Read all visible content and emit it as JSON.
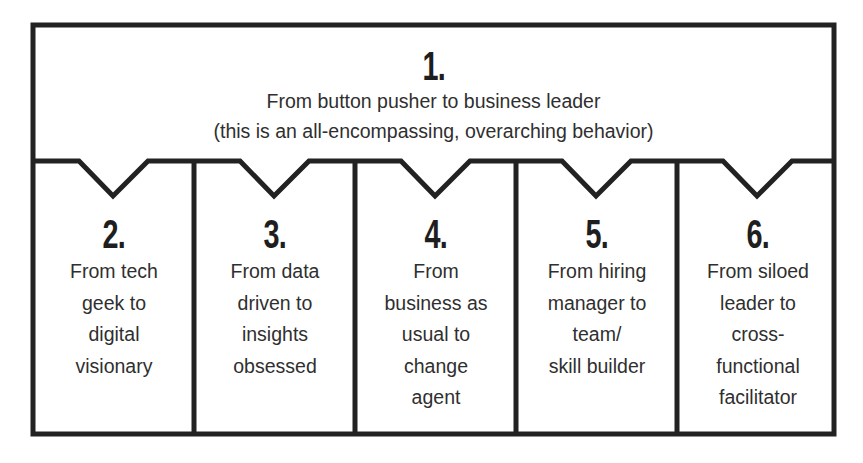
{
  "diagram": {
    "top": {
      "number": "1.",
      "title": "From button pusher to business leader",
      "subtitle": "(this is an all-encompassing, overarching behavior)"
    },
    "columns": [
      {
        "number": "2.",
        "lines": [
          "From tech",
          "geek to",
          "digital",
          "visionary"
        ]
      },
      {
        "number": "3.",
        "lines": [
          "From data",
          "driven to",
          "insights",
          "obsessed"
        ]
      },
      {
        "number": "4.",
        "lines": [
          "From",
          "business as",
          "usual to",
          "change",
          "agent"
        ]
      },
      {
        "number": "5.",
        "lines": [
          "From hiring",
          "manager to",
          "team/",
          "skill builder"
        ]
      },
      {
        "number": "6.",
        "lines": [
          "From siloed",
          "leader to",
          "cross-",
          "functional",
          "facilitator"
        ]
      }
    ],
    "colors": {
      "stroke": "#222222",
      "text": "#2f2f2f",
      "background": "#ffffff"
    }
  }
}
